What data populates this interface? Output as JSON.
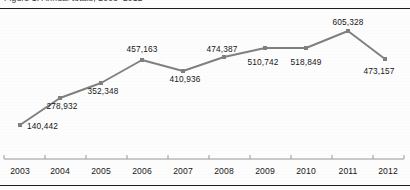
{
  "page": {
    "clipped_header_text": "Figure 1. Annual totals, 2003–2012",
    "background_color": "#fdfdfd",
    "rule_color": "#1d1d1d"
  },
  "chart_data": {
    "type": "line",
    "title": "",
    "subtitle": "",
    "xlabel": "",
    "ylabel": "",
    "categories": [
      "2003",
      "2004",
      "2005",
      "2006",
      "2007",
      "2008",
      "2009",
      "2010",
      "2011",
      "2012"
    ],
    "values": [
      140442,
      278932,
      352348,
      457163,
      410936,
      474387,
      510742,
      518849,
      605328,
      473157
    ],
    "value_labels": [
      "140,442",
      "278,932",
      "352,348",
      "457,163",
      "410,936",
      "474,387",
      "510,742",
      "518,849",
      "605,328",
      "473,157"
    ],
    "label_positions": [
      "right",
      "below",
      "below",
      "above",
      "below",
      "above",
      "below",
      "below",
      "above",
      "below"
    ],
    "ylim": [
      0,
      660000
    ],
    "grid": false,
    "legend": null,
    "series_color": "#808080",
    "marker": "square",
    "marker_size": 4,
    "axis_color": "#9a9a9a",
    "axis_ticks_up": true,
    "points": [
      {
        "year": "2003",
        "value": 140442,
        "label": "140,442",
        "x": 20,
        "y": 125,
        "lx": 27,
        "ly": 121,
        "align": "left"
      },
      {
        "year": "2004",
        "value": 278932,
        "label": "278,932",
        "x": 60,
        "y": 98,
        "lx": 62,
        "ly": 101,
        "align": "center"
      },
      {
        "year": "2005",
        "value": 352348,
        "label": "352,348",
        "x": 101,
        "y": 83,
        "lx": 103,
        "ly": 86,
        "align": "center"
      },
      {
        "year": "2006",
        "value": 457163,
        "label": "457,163",
        "x": 142,
        "y": 60,
        "lx": 142,
        "ly": 44,
        "align": "center"
      },
      {
        "year": "2007",
        "value": 410936,
        "label": "410,936",
        "x": 183,
        "y": 71,
        "lx": 185,
        "ly": 74,
        "align": "center"
      },
      {
        "year": "2008",
        "value": 474387,
        "label": "474,387",
        "x": 224,
        "y": 57,
        "lx": 222,
        "ly": 44,
        "align": "center"
      },
      {
        "year": "2009",
        "value": 510742,
        "label": "510,742",
        "x": 265,
        "y": 48,
        "lx": 263,
        "ly": 57,
        "align": "center"
      },
      {
        "year": "2010",
        "value": 518849,
        "label": "518,849",
        "x": 306,
        "y": 48,
        "lx": 306,
        "ly": 57,
        "align": "center"
      },
      {
        "year": "2011",
        "value": 605328,
        "label": "605,328",
        "x": 348,
        "y": 31,
        "lx": 348,
        "ly": 17,
        "align": "center"
      },
      {
        "year": "2012",
        "value": 473157,
        "label": "473,157",
        "x": 385,
        "y": 59,
        "lx": 379,
        "ly": 66,
        "align": "center"
      }
    ],
    "axis": {
      "y": 159,
      "x_start": 4,
      "x_end": 404,
      "tick_xs": [
        4,
        45,
        86,
        127,
        168,
        209,
        250,
        291,
        332,
        373,
        404
      ],
      "label_y": 166,
      "label_xs": [
        20,
        60,
        101,
        142,
        183,
        224,
        265,
        306,
        348,
        388
      ]
    }
  }
}
